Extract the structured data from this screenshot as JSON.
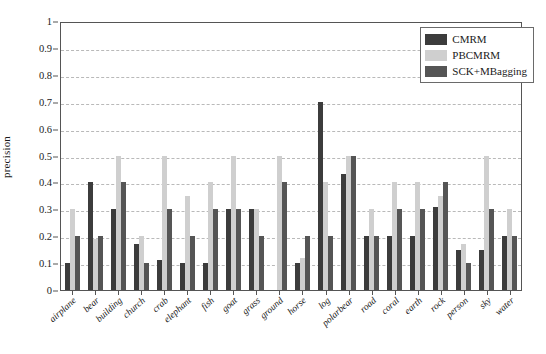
{
  "chart_data": {
    "type": "bar",
    "title": "",
    "xlabel": "",
    "ylabel": "precision",
    "ylim": [
      0,
      1
    ],
    "ytick_labels": [
      "0",
      "0.1",
      "0.2",
      "0.3",
      "0.4",
      "0.5",
      "0.6",
      "0.7",
      "0.8",
      "0.9",
      "1"
    ],
    "ytick_values": [
      0,
      0.1,
      0.2,
      0.3,
      0.4,
      0.5,
      0.6,
      0.7,
      0.8,
      0.9,
      1
    ],
    "grid": true,
    "legend_position": "top-right",
    "categories": [
      "airplane",
      "bear",
      "building",
      "church",
      "crab",
      "elephant",
      "fish",
      "goat",
      "grass",
      "ground",
      "horse",
      "log",
      "polarbear",
      "road",
      "coral",
      "earth",
      "rock",
      "person",
      "sky",
      "water"
    ],
    "series": [
      {
        "name": "CMRM",
        "color": "#3c3c3c",
        "values": [
          0.1,
          0.4,
          0.3,
          0.17,
          0.11,
          0.1,
          0.1,
          0.3,
          0.3,
          0.0,
          0.1,
          0.7,
          0.43,
          0.2,
          0.2,
          0.2,
          0.31,
          0.15,
          0.15,
          0.2
        ]
      },
      {
        "name": "PBCMRM",
        "color": "#cfcfcf",
        "values": [
          0.3,
          0.19,
          0.5,
          0.2,
          0.5,
          0.35,
          0.4,
          0.5,
          0.3,
          0.5,
          0.12,
          0.4,
          0.5,
          0.3,
          0.4,
          0.4,
          0.35,
          0.17,
          0.5,
          0.3
        ]
      },
      {
        "name": "SCK+MBagging",
        "color": "#555555",
        "values": [
          0.2,
          0.2,
          0.4,
          0.1,
          0.3,
          0.2,
          0.3,
          0.3,
          0.2,
          0.4,
          0.2,
          0.2,
          0.5,
          0.2,
          0.3,
          0.3,
          0.4,
          0.1,
          0.3,
          0.2
        ]
      }
    ]
  }
}
